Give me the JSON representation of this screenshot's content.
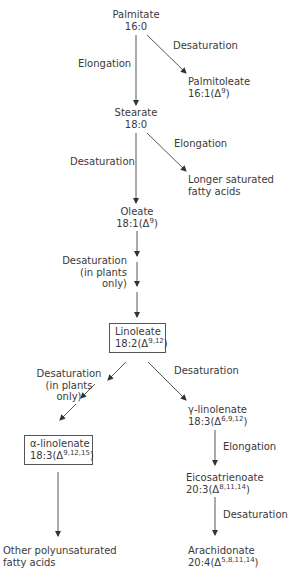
{
  "nodes": {
    "palmitate": {
      "name": "Palmitate",
      "formula": "16:0"
    },
    "palmitoleate": {
      "name": "Palmitoleate",
      "formula_prefix": "16:1(Δ",
      "sup": "9",
      "formula_suffix": ")"
    },
    "stearate": {
      "name": "Stearate",
      "formula": "18:0"
    },
    "longer_saturated": {
      "line1": "Longer saturated",
      "line2": "fatty acids"
    },
    "oleate": {
      "name": "Oleate",
      "formula_prefix": "18:1(Δ",
      "sup": "9",
      "formula_suffix": ")"
    },
    "linoleate": {
      "name": "Linoleate",
      "formula_prefix": "18:2(Δ",
      "sup": "9,12",
      "formula_suffix": ")"
    },
    "alpha_linolenate": {
      "name": "α-linolenate",
      "formula_prefix": "18:3(Δ",
      "sup": "9,12,15",
      "formula_suffix": ")"
    },
    "gamma_linolenate": {
      "name": "γ-linolenate",
      "formula_prefix": "18:3(Δ",
      "sup": "6,9,12",
      "formula_suffix": ")"
    },
    "eicosatrienoate": {
      "name": "Eicosatrienoate",
      "formula_prefix": "20:3(Δ",
      "sup": "8,11,14",
      "formula_suffix": ")"
    },
    "other_polyunsaturated": {
      "line1": "Other polyunsaturated",
      "line2": "fatty acids"
    },
    "arachidonate": {
      "name": "Arachidonate",
      "formula_prefix": "20:4(Δ",
      "sup": "5,8,11,14",
      "formula_suffix": ")"
    }
  },
  "edges": {
    "palmitate_to_stearate": "Elongation",
    "palmitate_to_palmitoleate": "Desaturation",
    "stearate_to_oleate": "Desaturation",
    "stearate_to_longer": "Elongation",
    "oleate_to_linoleate": {
      "line1": "Desaturation",
      "line2": "(in plants",
      "line3": "only)"
    },
    "linoleate_to_alpha": {
      "line1": "Desaturation",
      "line2": "(in plants",
      "line3": "only)"
    },
    "linoleate_to_gamma": "Desaturation",
    "gamma_to_eicosatrienoate": "Elongation",
    "eicosatrienoate_to_arachidonate": "Desaturation"
  },
  "colors": {
    "line": "#444444",
    "text": "#3a3a3a",
    "box_border": "#555555"
  }
}
